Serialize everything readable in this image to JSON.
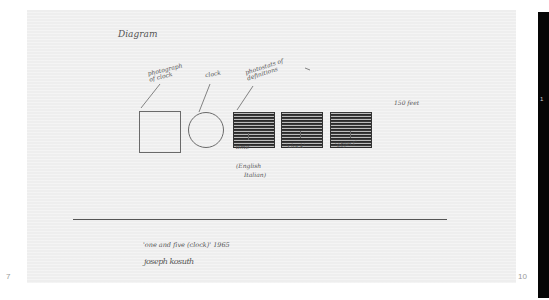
{
  "document": {
    "heading": "Diagram",
    "labels": {
      "photograph": "photograph of clock",
      "clock": "clock",
      "definitions": "photostats of definitions",
      "right_note": "150 feet",
      "time": "'time'",
      "clock_word": "'clock'",
      "object": "'object'",
      "language_line1": "(English",
      "language_line2": "Italian)"
    },
    "caption": {
      "line1": "'one and five (clock)' 1965",
      "line2": "joseph kosuth"
    },
    "page_numbers": {
      "left": "7",
      "right": "10"
    },
    "panel_mark": "1"
  }
}
